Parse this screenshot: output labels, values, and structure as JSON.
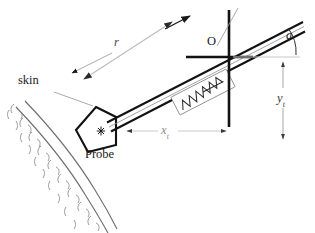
{
  "figure": {
    "kind": "technical-line-diagram",
    "background_color": "#ffffff",
    "stroke_color": "#1a1a1a",
    "light_stroke_color": "#9a9a9a",
    "dimension_color": "#b0b0b0",
    "width": 315,
    "height": 233
  },
  "labels": {
    "skin": "skin",
    "probe": "Probe",
    "origin": "O",
    "radius": "r",
    "angle": "a",
    "y_target_main": "y",
    "y_target_sub": "t",
    "x_target_main": "x",
    "x_target_sub": "t"
  },
  "elements": {
    "skin_arc": {
      "name": "skin-surface-arc",
      "description": "double curved line with squiggle hatching on outer side representing tissue"
    },
    "probe": {
      "name": "ultrasound-probe",
      "description": "tilted quadrilateral with asterisk marker at center",
      "marker": "*"
    },
    "needle": {
      "name": "needle-shaft",
      "description": "three parallel lines running from probe up-right past origin"
    },
    "spring": {
      "name": "spring-zigzag-symbol",
      "description": "zigzag inside thin rotated rectangle along needle axis"
    },
    "axes": {
      "name": "origin-crosshair-axes",
      "description": "thick vertical and horizontal reference lines crossing at O"
    },
    "insertion_arrow": {
      "name": "insertion-direction-arrow",
      "description": "arrowhead along needle axis pointing up-right"
    },
    "r_dimension": {
      "name": "radius-dimension-arrow",
      "description": "double-headed gray dimension arrow labelled r"
    },
    "angle_arc": {
      "name": "angle-arc",
      "description": "arc between horizontal reference and needle axis labelled a"
    },
    "y_dimension": {
      "name": "y-target-dimension-arrow",
      "description": "vertical double-headed dashed-gap dimension arrow labelled y_t"
    },
    "x_dimension": {
      "name": "x-target-dimension-arrow",
      "description": "horizontal double-headed dimension arrow labelled x_t"
    }
  }
}
